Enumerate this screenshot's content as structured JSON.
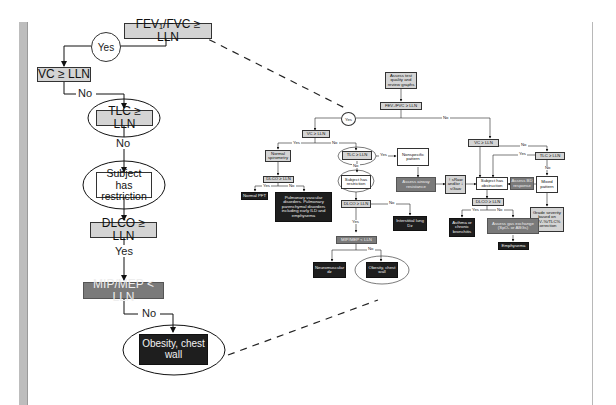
{
  "detail_flowchart": {
    "fev_fvc": "FEV₁/FVC ≥ LLN",
    "yes_circle": "Yes",
    "vc": "VC ≥ LLN",
    "no_1": "No",
    "tlc": "TLC ≥ LLN",
    "no_2": "No",
    "restriction": "Subject has restriction",
    "dlco": "DLCO ≥ LLN",
    "yes_2": "Yes",
    "mip_mep": "MIP/MEP < LLN",
    "no_3": "No",
    "obesity": "Obesity, chest wall"
  },
  "full_flowchart": {
    "assess_test": "Assess test quality and review graphs",
    "fev_fvc": "FEV₁/FVC ≥ LLN",
    "yes_circle": "Yes",
    "no_top": "No",
    "vc_left": "VC ≥ LLN",
    "yes_vc_left": "Yes",
    "no_vc_left": "No",
    "normal_spirometry": "Normal spirometry",
    "dlco_normal": "DLCO ≥ LLN",
    "yes_dlco_normal": "Yes",
    "no_dlco_normal": "No",
    "normal_pft": "Normal PFT",
    "pulm_vascular": "Pulmonary vascular disorders. Pulmonary parenchymal disorders including early ILD and emphysema",
    "tlc_mid": "TLC ≥ LLN",
    "yes_tlc_mid": "Yes",
    "no_tlc_mid": "No",
    "nonspecific": "Nonspecific pattern",
    "restriction": "Subject has restriction",
    "dlco_restr": "DLCO ≥ LLN",
    "no_dlco_restr": "No",
    "yes_dlco_restr": "Yes",
    "interstitial": "Interstitial lung Dz",
    "mip_mep": "MIP/MEP < LLN",
    "no_mip": "No",
    "neuromuscular": "Neuromuscular dz",
    "obesity": "Obesity, chest wall",
    "airway_resistance": "Assess airway resistance",
    "sraw": "↑ sRaw and/or ↓ sGaw",
    "vc_right": "VC ≥ LLN",
    "no_vc_right": "No",
    "tlc_right": "TLC ≥ LLN",
    "yes_tlc_right": "Yes",
    "no_tlc_right": "No",
    "obstruction": "Subject has obstruction",
    "bd_response": "Assess BD response",
    "mixed": "Mixed pattern",
    "grade": "Grade severity based on FEV₁%/TLC% correction",
    "dlco_obs": "DLCO ≥ LLN",
    "yes_dlco_obs": "Yes",
    "no_dlco_obs": "No",
    "asthma": "Asthma or chronic bronchitis",
    "gas_exchange": "Assess gas exchange (SpO₂ or ABGs)",
    "emphysema": "Emphysema"
  },
  "colors": {
    "light_gray_box": "#d4d4d4",
    "medium_gray_box": "#7a7a7a",
    "dark_box": "#1e1e1e",
    "left_bar": "#bdbdbd"
  }
}
